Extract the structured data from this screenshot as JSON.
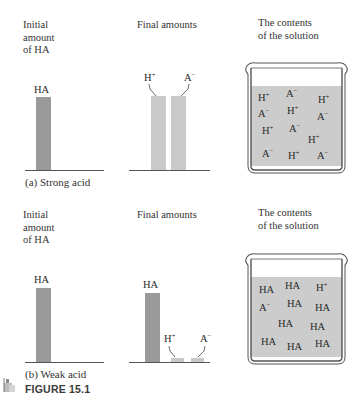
{
  "figure": {
    "label": "FIGURE 15.1",
    "colors": {
      "dark_bar": "#9a9a9a",
      "light_bar": "#c9c9c9",
      "solution": "#cccccc",
      "beaker_outline": "#555555"
    }
  },
  "panel_a": {
    "initial_header": "Initial\namount\nof HA",
    "final_header": "Final amounts",
    "contents_header": "The contents\nof the solution",
    "initial_bar_label": "HA",
    "final_bars": [
      {
        "label": "H",
        "charge": "+"
      },
      {
        "label": "A",
        "charge": "−"
      }
    ],
    "caption": "(a)  Strong acid",
    "solution_ions": [
      {
        "label": "H",
        "charge": "+"
      },
      {
        "label": "A",
        "charge": "−"
      },
      {
        "label": "H",
        "charge": "+"
      },
      {
        "label": "A",
        "charge": "−"
      },
      {
        "label": "H",
        "charge": "+"
      },
      {
        "label": "A",
        "charge": "−"
      },
      {
        "label": "H",
        "charge": "+"
      },
      {
        "label": "A",
        "charge": "−"
      },
      {
        "label": "H",
        "charge": "+"
      },
      {
        "label": "A",
        "charge": "−"
      },
      {
        "label": "H",
        "charge": "+"
      },
      {
        "label": "A",
        "charge": "−"
      }
    ]
  },
  "panel_b": {
    "initial_header": "Initial\namount\nof HA",
    "final_header": "Final amounts",
    "contents_header": "The contents\nof the solution",
    "initial_bar_label": "HA",
    "final_bars": [
      {
        "label": "HA",
        "charge": ""
      },
      {
        "label": "H",
        "charge": "+"
      },
      {
        "label": "A",
        "charge": "−"
      }
    ],
    "caption": "(b)  Weak acid",
    "solution_ions": [
      {
        "label": "HA",
        "charge": ""
      },
      {
        "label": "HA",
        "charge": ""
      },
      {
        "label": "H",
        "charge": "+"
      },
      {
        "label": "A",
        "charge": "−"
      },
      {
        "label": "HA",
        "charge": ""
      },
      {
        "label": "HA",
        "charge": ""
      },
      {
        "label": "HA",
        "charge": ""
      },
      {
        "label": "HA",
        "charge": ""
      },
      {
        "label": "HA",
        "charge": ""
      },
      {
        "label": "HA",
        "charge": ""
      },
      {
        "label": "HA",
        "charge": ""
      }
    ]
  }
}
